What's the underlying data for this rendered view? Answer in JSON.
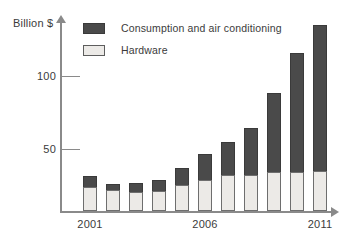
{
  "chart_data": {
    "type": "bar",
    "stacked": true,
    "title": "",
    "subtitle": "",
    "xlabel": "",
    "ylabel": "Billion $",
    "ylim": [
      0,
      135
    ],
    "yticks": [
      50,
      100
    ],
    "ytick_labels": [
      "50",
      "100"
    ],
    "grid": false,
    "legend_position": "top-left",
    "categories": [
      "2001",
      "2002",
      "2003",
      "2004",
      "2005",
      "2006",
      "2007",
      "2008",
      "2009",
      "2010",
      "2011"
    ],
    "xtick_labels_shown": [
      "2001",
      "2006",
      "2011"
    ],
    "series": [
      {
        "name": "Hardware",
        "color": "#eceae7",
        "values": [
          17,
          15,
          13,
          14,
          18,
          22,
          25,
          25,
          27,
          27,
          28
        ]
      },
      {
        "name": "Consumption and air conditioning",
        "color": "#4a4a4a",
        "values": [
          8,
          4,
          6,
          8,
          12,
          18,
          23,
          33,
          55,
          83,
          102
        ]
      }
    ],
    "totals": [
      25,
      19,
      19,
      22,
      30,
      40,
      48,
      58,
      82,
      110,
      130
    ]
  },
  "axis": {
    "y_title": "Billion $",
    "ytick_100": "100",
    "ytick_50": "50"
  },
  "legend": {
    "items": [
      {
        "label": "Consumption and air conditioning",
        "swatch": "dark-square-icon"
      },
      {
        "label": "Hardware",
        "swatch": "light-square-icon"
      }
    ]
  },
  "xlabels": [
    {
      "text": "2001",
      "index": 0
    },
    {
      "text": "2006",
      "index": 5
    },
    {
      "text": "2011",
      "index": 10
    }
  ],
  "colors": {
    "dark": "#4a4a4a",
    "light": "#eceae7",
    "axis": "#8a8a8a",
    "text": "#3b3b3b"
  }
}
